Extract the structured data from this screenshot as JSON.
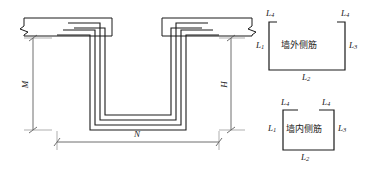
{
  "drawing": {
    "title": "wall-tie-rebar-detail",
    "line_color": "#1a1a1a",
    "dim_color": "#555555",
    "background": "#ffffff"
  },
  "main_view": {
    "name": "nested-u-bar-section",
    "dimensions": [
      {
        "id": "M",
        "label": "M",
        "orientation": "vertical",
        "side": "left"
      },
      {
        "id": "H",
        "label": "H",
        "orientation": "vertical",
        "side": "right"
      },
      {
        "id": "N",
        "label": "N",
        "orientation": "horizontal",
        "side": "bottom"
      }
    ],
    "break_lines": 2,
    "nested_bar_count": 4
  },
  "legend": {
    "outer": {
      "name": "outer-wall-bar-legend",
      "caption": "墙外侧筋",
      "labels": {
        "left_leg": "L",
        "left_leg_sub": "1",
        "bottom": "L",
        "bottom_sub": "2",
        "right_leg": "L",
        "right_leg_sub": "3",
        "hook_left": "L",
        "hook_left_sub": "4",
        "hook_right": "L",
        "hook_right_sub": "4"
      }
    },
    "inner": {
      "name": "inner-wall-bar-legend",
      "caption": "墙内侧筋",
      "labels": {
        "left_leg": "L",
        "left_leg_sub": "1",
        "bottom": "L",
        "bottom_sub": "2",
        "right_leg": "L",
        "right_leg_sub": "3",
        "hook_left": "L",
        "hook_left_sub": "4",
        "hook_right": "L",
        "hook_right_sub": "4"
      }
    }
  }
}
